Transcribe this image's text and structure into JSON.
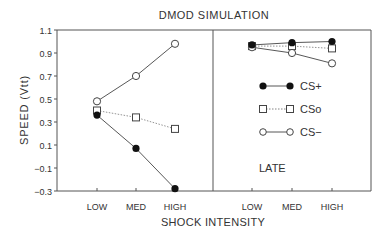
{
  "chart_data": {
    "type": "line",
    "title": "DMOD  SIMULATION",
    "xlabel": "SHOCK  INTENSITY",
    "ylabel": "SPEED  (Vtt)",
    "ylim": [
      -0.3,
      1.1
    ],
    "yticks": [
      1.1,
      0.9,
      0.7,
      0.5,
      0.3,
      0.1,
      -0.1,
      -0.3
    ],
    "ytick_labels": [
      "1.1",
      "0.9",
      "0.7",
      "0.5",
      "0.3",
      "0.1",
      "-0.1",
      "-0.3"
    ],
    "categories": [
      "LOW",
      "MED",
      "HIGH"
    ],
    "grid": false,
    "legend_position": "right panel, middle",
    "panels": [
      {
        "name": "early",
        "label": "",
        "series": [
          {
            "name": "CS+",
            "marker": "filled-circle",
            "line": "solid",
            "values": [
              0.36,
              0.07,
              -0.28
            ]
          },
          {
            "name": "CSo",
            "marker": "open-square",
            "line": "dotted",
            "values": [
              0.4,
              0.34,
              0.24
            ]
          },
          {
            "name": "CS−",
            "marker": "open-circle",
            "line": "solid",
            "values": [
              0.48,
              0.7,
              0.98
            ]
          }
        ]
      },
      {
        "name": "late",
        "label": "LATE",
        "series": [
          {
            "name": "CS+",
            "marker": "filled-circle",
            "line": "solid",
            "values": [
              0.97,
              0.99,
              1.0
            ]
          },
          {
            "name": "CSo",
            "marker": "open-square",
            "line": "dotted",
            "values": [
              0.96,
              0.96,
              0.94
            ]
          },
          {
            "name": "CS−",
            "marker": "open-circle",
            "line": "solid",
            "values": [
              0.95,
              0.9,
              0.81
            ]
          }
        ]
      }
    ]
  },
  "legend": {
    "cs_plus": "CS+",
    "cs_o": "CSo",
    "cs_minus": "CS−"
  },
  "panel_labels": {
    "late": "LATE"
  }
}
